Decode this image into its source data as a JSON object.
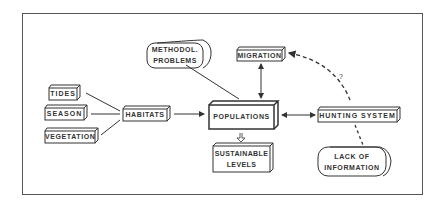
{
  "diagram": {
    "nodes": {
      "tides": "TIDES",
      "season": "SEASON",
      "vegetation": "VEGETATION",
      "habitats": "HABITATS",
      "methodol_line1": "METHODOL.",
      "methodol_line2": "PROBLEMS",
      "migration": "MIGRATION",
      "populations": "POPULATIONS",
      "sustainable_line1": "SUSTAINABLE",
      "sustainable_line2": "LEVELS",
      "hunting": "HUNTING SYSTEM",
      "lack_line1": "LACK OF",
      "lack_line2": "INFORMATION"
    },
    "annotations": {
      "question_mark": "?"
    },
    "edges": [
      {
        "from": "TIDES",
        "to": "HABITATS",
        "style": "line"
      },
      {
        "from": "SEASON",
        "to": "HABITATS",
        "style": "line"
      },
      {
        "from": "VEGETATION",
        "to": "HABITATS",
        "style": "line"
      },
      {
        "from": "HABITATS",
        "to": "POPULATIONS",
        "style": "arrow"
      },
      {
        "from": "METHODOL. PROBLEMS",
        "to": "POPULATIONS",
        "style": "line"
      },
      {
        "from": "MIGRATION",
        "to": "POPULATIONS",
        "style": "double-arrow"
      },
      {
        "from": "POPULATIONS",
        "to": "HUNTING SYSTEM",
        "style": "double-arrow"
      },
      {
        "from": "POPULATIONS",
        "to": "SUSTAINABLE LEVELS",
        "style": "hollow-arrow"
      },
      {
        "from": "HUNTING SYSTEM",
        "to": "MIGRATION",
        "style": "dashed-arrow",
        "label": "?"
      },
      {
        "from": "LACK OF INFORMATION",
        "to": "HUNTING SYSTEM",
        "style": "dashed"
      }
    ]
  }
}
